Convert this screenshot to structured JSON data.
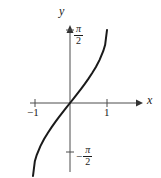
{
  "figure": {
    "background_color": "#ffffff",
    "axis_color": "#4d4d4d",
    "curve_color": "#1a1a1a",
    "text_color": "#1a1a1a"
  },
  "labels": {
    "x_axis": "x",
    "y_axis": "y",
    "tick_neg_one": "−1",
    "tick_pos_one": "1",
    "pi_numerator": "π",
    "pi_denominator": "2",
    "minus_sign": "−"
  },
  "chart_data": {
    "type": "line",
    "title": "",
    "xlabel": "x",
    "ylabel": "y",
    "function": "y = arcsin(x)",
    "xlim": [
      -1.35,
      1.35
    ],
    "ylim": [
      -2.05,
      2.05
    ],
    "grid": false,
    "legend": null,
    "xticks": [
      -1,
      1
    ],
    "xticklabels": [
      "−1",
      "1"
    ],
    "yticks": [
      1.5708,
      -1.5708
    ],
    "yticklabels": [
      "π/2",
      "−π/2"
    ],
    "series": [
      {
        "name": "arcsin(x)",
        "x": [
          -1.0,
          -0.95,
          -0.9,
          -0.8,
          -0.7,
          -0.6,
          -0.5,
          -0.4,
          -0.3,
          -0.2,
          -0.1,
          0.0,
          0.1,
          0.2,
          0.3,
          0.4,
          0.5,
          0.6,
          0.7,
          0.8,
          0.9,
          0.95,
          1.0
        ],
        "y": [
          -1.5708,
          -1.2532,
          -1.1198,
          -0.9273,
          -0.7754,
          -0.6435,
          -0.5236,
          -0.4115,
          -0.3047,
          -0.2014,
          -0.1002,
          0.0,
          0.1002,
          0.2014,
          0.3047,
          0.4115,
          0.5236,
          0.6435,
          0.7754,
          0.9273,
          1.1198,
          1.2532,
          1.5708
        ]
      }
    ]
  },
  "geometry": {
    "origin_x": 70,
    "origin_y": 103,
    "x_axis_start": 30,
    "x_axis_end": 143,
    "y_axis_top": 25,
    "y_axis_bottom": 172,
    "tick_x_neg_one": 35,
    "tick_x_pos_one": 107,
    "tick_y_pi_half": 30,
    "tick_y_neg_pi_half": 152,
    "curve_path": "M 33.5,152 C 38,142 44,131 50,122 C 56,113 62,107 70,103 C 78,99 84,93 90,84 C 96,73 102,58 107,46 C 110,39 112.5,34 115,30"
  }
}
